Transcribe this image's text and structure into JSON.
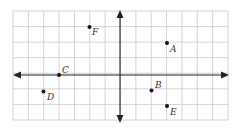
{
  "chart_data": {
    "type": "scatter",
    "title": "",
    "xlabel": "",
    "ylabel": "",
    "grid": true,
    "xlim": [
      -7,
      7
    ],
    "ylim": [
      -3,
      4
    ],
    "axes_arrows": true,
    "tick_labels": false,
    "points": [
      {
        "label": "A",
        "x": 3,
        "y": 2
      },
      {
        "label": "B",
        "x": 2,
        "y": -1
      },
      {
        "label": "C",
        "x": -4,
        "y": 0
      },
      {
        "label": "D",
        "x": -5,
        "y": -1
      },
      {
        "label": "E",
        "x": 3,
        "y": -2
      },
      {
        "label": "F",
        "x": -2,
        "y": 3
      }
    ]
  },
  "colors": {
    "grid": "#c8c8c8",
    "axis": "#222222",
    "point": "#111111",
    "label": "#333333"
  },
  "labels": {
    "A": "A",
    "B": "B",
    "C": "C",
    "D": "D",
    "E": "E",
    "F": "F"
  }
}
